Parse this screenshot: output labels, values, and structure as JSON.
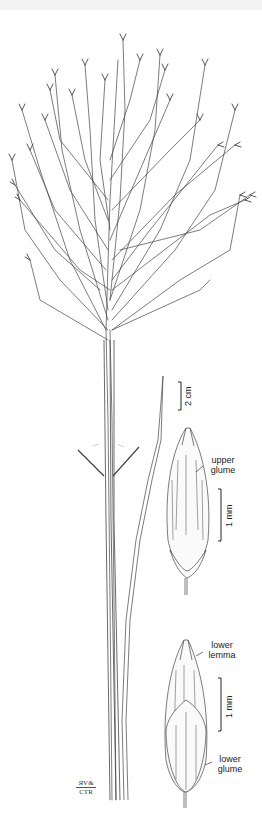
{
  "illustration": {
    "subject": "grass plant with open panicle, culm, leaf blade and spikelet details",
    "colors": {
      "ink": "#3a3a3a",
      "background": "#ffffff"
    }
  },
  "scale_bars": {
    "habit": "2 cm",
    "upper_spikelet": "1 mm",
    "lower_spikelet": "1 mm"
  },
  "labels": {
    "upper_glume": [
      "upper",
      "glume"
    ],
    "lower_lemma": [
      "lower",
      "lemma"
    ],
    "lower_glume": [
      "lower",
      "glume"
    ]
  },
  "signature": {
    "line1": "ЯV&",
    "line2": "CTR"
  }
}
